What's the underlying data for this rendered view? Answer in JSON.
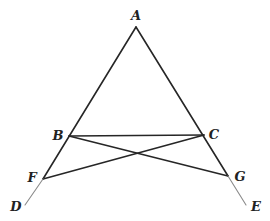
{
  "diagram": {
    "type": "geometry",
    "colors": {
      "line": "#262626",
      "extension": "#8a8a8a",
      "label": "#222222",
      "background": "#ffffff"
    },
    "points": {
      "A": {
        "label": "A",
        "x": 136,
        "y": 27,
        "lx": 136,
        "ly": 20
      },
      "B": {
        "label": "B",
        "x": 69,
        "y": 136,
        "lx": 58,
        "ly": 140
      },
      "C": {
        "label": "C",
        "x": 204,
        "y": 135,
        "lx": 214,
        "ly": 139
      },
      "F": {
        "label": "F",
        "x": 43,
        "y": 179,
        "lx": 32,
        "ly": 182
      },
      "G": {
        "label": "G",
        "x": 228,
        "y": 176,
        "lx": 240,
        "ly": 181
      },
      "D": {
        "label": "D",
        "x": 25,
        "y": 205,
        "lx": 16,
        "ly": 211
      },
      "E": {
        "label": "E",
        "x": 246,
        "y": 205,
        "lx": 256,
        "ly": 211
      }
    },
    "segments": [
      {
        "from": "A",
        "to": "F",
        "style": "main"
      },
      {
        "from": "A",
        "to": "G",
        "style": "main"
      },
      {
        "from": "B",
        "to": "C",
        "style": "main"
      },
      {
        "from": "B",
        "to": "G",
        "style": "main"
      },
      {
        "from": "C",
        "to": "F",
        "style": "main"
      },
      {
        "from": "F",
        "to": "D",
        "style": "extension"
      },
      {
        "from": "G",
        "to": "E",
        "style": "extension"
      }
    ]
  }
}
